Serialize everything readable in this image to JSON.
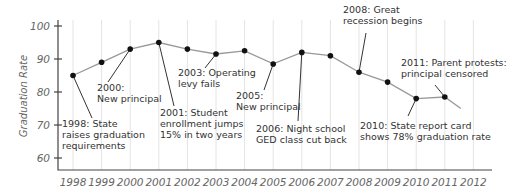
{
  "chart_data": {
    "type": "line",
    "title": "",
    "xlabel": "",
    "ylabel": "Graduation Rate",
    "ylim": [
      58,
      100
    ],
    "yticks": [
      60,
      70,
      80,
      90,
      100
    ],
    "grid": "vertical",
    "categories": [
      "1998",
      "1999",
      "2000",
      "2001",
      "2002",
      "2003",
      "2004",
      "2005",
      "2006",
      "2007",
      "2008",
      "2009",
      "2010",
      "2011",
      "2012"
    ],
    "series": [
      {
        "name": "Graduation Rate",
        "x": [
          "1998",
          "1999",
          "2000",
          "2001",
          "2002",
          "2003",
          "2004",
          "2005",
          "2006",
          "2007",
          "2008",
          "2009",
          "2010",
          "2011"
        ],
        "values": [
          85,
          89,
          93,
          95,
          93,
          91.5,
          92.5,
          88.5,
          92,
          91,
          86,
          83,
          78,
          78.5
        ],
        "trailing_value": 75
      }
    ],
    "annotations": [
      {
        "year": "1998",
        "lines": [
          "1998: State",
          "raises graduation",
          "requirements"
        ],
        "tx": 62,
        "ty": 127,
        "lx2": 92,
        "ly2": 118
      },
      {
        "year": "2000",
        "lines": [
          "2000:",
          "New principal"
        ],
        "tx": 97,
        "ty": 91,
        "lx2": 108,
        "ly2": 82
      },
      {
        "year": "2001",
        "lines": [
          "2001: Student",
          "enrollment jumps",
          "15% in two years"
        ],
        "tx": 160,
        "ty": 116,
        "lx2": 174,
        "ly2": 106
      },
      {
        "year": "2003",
        "lines": [
          "2003: Operating",
          "levy fails"
        ],
        "tx": 178,
        "ty": 76,
        "lx2": 205,
        "ly2": 68
      },
      {
        "year": "2005",
        "lines": [
          "2005:",
          "New principal"
        ],
        "tx": 236,
        "ty": 99,
        "lx2": 264,
        "ly2": 90
      },
      {
        "year": "2006",
        "lines": [
          "2006: Night school",
          "GED class cut back"
        ],
        "tx": 256,
        "ty": 132,
        "lx2": 298,
        "ly2": 121
      },
      {
        "year": "2008",
        "lines": [
          "2008: Great",
          "recession begins"
        ],
        "tx": 343,
        "ty": 13,
        "lx2": 366,
        "ly2": 33
      },
      {
        "year": "2010",
        "lines": [
          "2010: State report card",
          "shows 78% graduation rate"
        ],
        "tx": 360,
        "ty": 129,
        "lx2": 408,
        "ly2": 116
      },
      {
        "year": "2011",
        "lines": [
          "2011: Parent protests:",
          "principal censored"
        ],
        "tx": 401,
        "ty": 66,
        "lx2": 435,
        "ly2": 85
      }
    ]
  }
}
